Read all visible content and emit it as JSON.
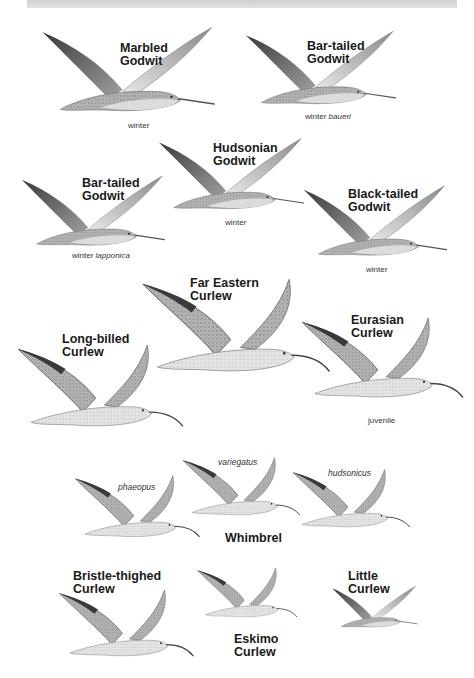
{
  "plate": {
    "colors": {
      "background": "#ffffff",
      "header_band": "#d8d8d8",
      "label": "#1a1a1a",
      "bird_dark": "#555555",
      "bird_mid": "#9a9a9a",
      "bird_light": "#e2e2e2"
    },
    "birds": [
      {
        "name_line1": "Marbled",
        "name_line2": "Godwit",
        "caption": "winter",
        "caption_italic": ""
      },
      {
        "name_line1": "Bar-tailed",
        "name_line2": "Godwit",
        "caption": "winter",
        "caption_italic": "baueri"
      },
      {
        "name_line1": "Hudsonian",
        "name_line2": "Godwit",
        "caption": "winter",
        "caption_italic": ""
      },
      {
        "name_line1": "Bar-tailed",
        "name_line2": "Godwit",
        "caption": "winter",
        "caption_italic": "lapponica"
      },
      {
        "name_line1": "Black-tailed",
        "name_line2": "Godwit",
        "caption": "winter",
        "caption_italic": ""
      },
      {
        "name_line1": "Far Eastern",
        "name_line2": "Curlew",
        "caption": "",
        "caption_italic": ""
      },
      {
        "name_line1": "Long-billed",
        "name_line2": "Curlew",
        "caption": "",
        "caption_italic": ""
      },
      {
        "name_line1": "Eurasian",
        "name_line2": "Curlew",
        "caption": "juvenile",
        "caption_italic": ""
      },
      {
        "name_line1": "Bristle-thighed",
        "name_line2": "Curlew",
        "caption": "",
        "caption_italic": ""
      },
      {
        "name_line1": "Eskimo",
        "name_line2": "Curlew",
        "caption": "",
        "caption_italic": ""
      },
      {
        "name_line1": "Little",
        "name_line2": "Curlew",
        "caption": "",
        "caption_italic": ""
      }
    ],
    "whimbrel": {
      "name": "Whimbrel",
      "subspecies": [
        "phaeopus",
        "variegatus",
        "hudsonicus"
      ]
    }
  }
}
